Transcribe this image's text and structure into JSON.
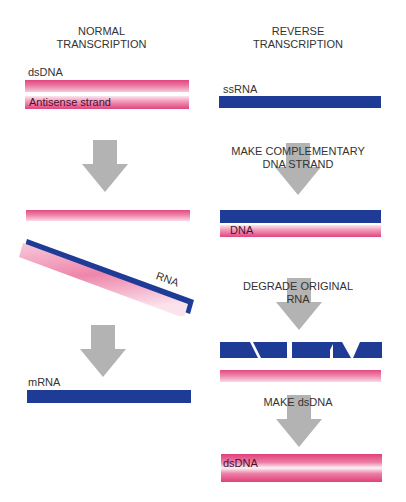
{
  "left": {
    "title_line1": "NORMAL",
    "title_line2": "TRANSCRIPTION",
    "dsdna_label": "dsDNA",
    "antisense_label": "Antisense strand",
    "rna_label": "RNA",
    "mrna_label": "mRNA"
  },
  "right": {
    "title_line1": "REVERSE",
    "title_line2": "TRANSCRIPTION",
    "ssrna_label": "ssRNA",
    "step1_line1": "MAKE COMPLEMENTARY",
    "step1_line2": "DNA STRAND",
    "dna_label": "DNA",
    "step2_line1": "DEGRADE ORIGINAL",
    "step2_line2": "RNA",
    "step3": "MAKE dsDNA",
    "dsdna_label": "dsDNA"
  },
  "colors": {
    "rna_blue": "#1e3c96",
    "dna_pink": "#e0457e",
    "arrow_gray": "#b3b3b3"
  }
}
